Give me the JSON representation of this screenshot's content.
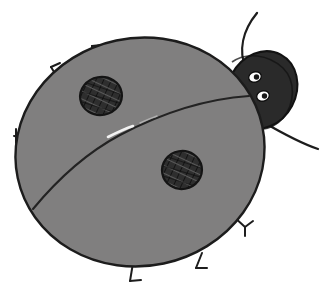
{
  "illustration": {
    "title": "Ladybug",
    "subject": "ladybug",
    "style": "hand-drawn childrens-book clip art",
    "background_color": "#ffffff",
    "canvas": {
      "width": 325,
      "height": 303
    }
  },
  "colors": {
    "background": "#ffffff",
    "body_fill": "#807f7f",
    "body_outline": "#1c1c1c",
    "head_fill": "#2a2a2a",
    "head_outline": "#121212",
    "spot_fill": "#2e2e2e",
    "spot_outline": "#141414",
    "eye_white": "#fdfdfd",
    "eye_pupil": "#161616",
    "leg_stroke": "#1d1d1d",
    "wing_split_stroke": "#232323",
    "highlight": "#f2f2f2"
  },
  "parts": {
    "body": {
      "name": "body",
      "shape": "large tilted oval shell",
      "center_x": 140,
      "center_y": 152,
      "radius_x": 125,
      "radius_y": 114,
      "rotation_deg": -12,
      "fill": "#807f7f",
      "stroke_width": 2.2
    },
    "head": {
      "name": "head",
      "shape": "dark rounded wedge at upper right",
      "center_x": 262,
      "center_y": 90,
      "radius_x": 34,
      "radius_y": 40,
      "rotation_deg": 28,
      "fill": "#2a2a2a"
    },
    "wing_split": {
      "name": "wing-split-line",
      "description": "diagonal seam from head down to lower left edge",
      "from_x": 247,
      "from_y": 97,
      "to_x": 33,
      "to_y": 208,
      "has_highlight": true,
      "highlight_x": 120,
      "highlight_y": 130
    },
    "spots": [
      {
        "name": "spot-upper-left",
        "center_x": 101,
        "center_y": 96,
        "radius_x": 21,
        "radius_y": 19,
        "rotation_deg": -10,
        "texture": "cross-hatch"
      },
      {
        "name": "spot-lower-middle",
        "center_x": 182,
        "center_y": 170,
        "radius_x": 20,
        "radius_y": 19,
        "rotation_deg": -10,
        "texture": "cross-hatch"
      }
    ],
    "eyes": [
      {
        "name": "eye-upper",
        "center_x": 255,
        "center_y": 77,
        "radius_x": 6.2,
        "radius_y": 5.0,
        "rotation_deg": -18,
        "pupil_x": 256,
        "pupil_y": 77,
        "pupil_radius": 2.6
      },
      {
        "name": "eye-lower",
        "center_x": 263,
        "center_y": 95,
        "radius_x": 6.2,
        "radius_y": 5.0,
        "rotation_deg": -18,
        "pupil_x": 264,
        "pupil_y": 95,
        "pupil_radius": 2.6
      }
    ],
    "antenna": {
      "name": "antenna",
      "description": "single thin curved antenna rising from head to upper right",
      "from_x": 244,
      "from_y": 68,
      "to_x": 256,
      "to_y": 13
    },
    "front_leg": {
      "name": "front-leg",
      "description": "long thin leg sweeping from head down to the right",
      "from_x": 266,
      "from_y": 124,
      "to_x": 318,
      "to_y": 149
    },
    "legs": [
      {
        "name": "leg-top-left-upper",
        "description": "hooked leg at top of shell",
        "count_label": "leg 1"
      },
      {
        "name": "leg-upper-left",
        "description": "hooked leg upper left of shell",
        "count_label": "leg 2"
      },
      {
        "name": "leg-left",
        "description": "T-shaped leg at left of shell",
        "count_label": "leg 3"
      },
      {
        "name": "leg-bottom-left",
        "description": "L-shaped foot at bottom of shell",
        "count_label": "leg 4"
      },
      {
        "name": "leg-bottom-right",
        "description": "L-shaped foot at lower right of shell",
        "count_label": "leg 5"
      },
      {
        "name": "leg-right",
        "description": "Y-shaped leg at right of shell",
        "count_label": "leg 6"
      }
    ]
  },
  "counts": {
    "spots": 2,
    "eyes": 2,
    "legs": 6,
    "antennae": 1
  }
}
